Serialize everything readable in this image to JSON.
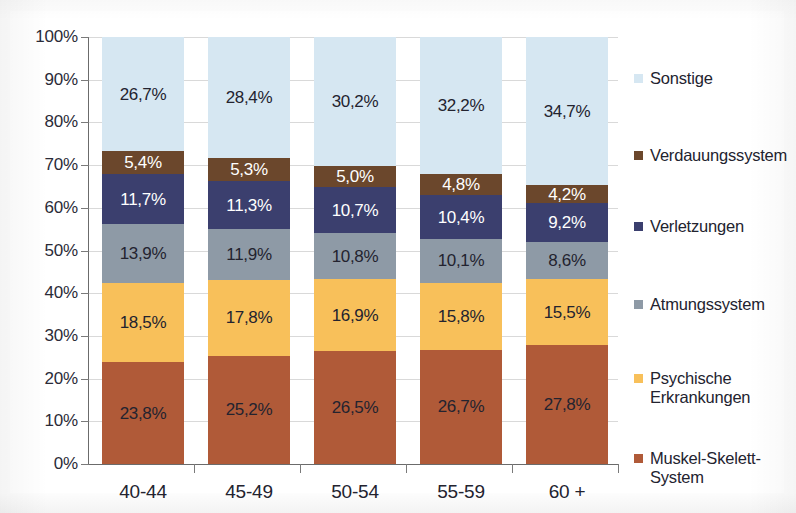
{
  "chart_data": {
    "type": "bar",
    "subtype": "stacked-100-percent",
    "title": "",
    "xlabel": "",
    "ylabel": "",
    "ylim": [
      0,
      100
    ],
    "ytick_labels": [
      "0%",
      "10%",
      "20%",
      "30%",
      "40%",
      "50%",
      "60%",
      "70%",
      "80%",
      "90%",
      "100%"
    ],
    "ytick_values": [
      0,
      10,
      20,
      30,
      40,
      50,
      60,
      70,
      80,
      90,
      100
    ],
    "grid": true,
    "legend_position": "right",
    "categories": [
      "40-44",
      "45-49",
      "50-54",
      "55-59",
      "60 +"
    ],
    "series": [
      {
        "name": "Muskel-Skelett-System",
        "legend_label": "Muskel-Skelett-\nSystem",
        "color": "#b05a38",
        "label_color": "#23232f",
        "values": [
          23.8,
          25.2,
          26.5,
          26.7,
          27.8
        ],
        "value_labels": [
          "23,8%",
          "25,2%",
          "26,5%",
          "26,7%",
          "27,8%"
        ]
      },
      {
        "name": "Psychische Erkrankungen",
        "legend_label": "Psychische\nErkrankungen",
        "color": "#f8c05a",
        "label_color": "#23232f",
        "values": [
          18.5,
          17.8,
          16.9,
          15.8,
          15.5
        ],
        "value_labels": [
          "18,5%",
          "17,8%",
          "16,9%",
          "15,8%",
          "15,5%"
        ]
      },
      {
        "name": "Atmungssystem",
        "legend_label": "Atmungssystem",
        "color": "#8e9aa6",
        "label_color": "#23232f",
        "values": [
          13.9,
          11.9,
          10.8,
          10.1,
          8.6
        ],
        "value_labels": [
          "13,9%",
          "11,9%",
          "10,8%",
          "10,1%",
          "8,6%"
        ]
      },
      {
        "name": "Verletzungen",
        "legend_label": "Verletzungen",
        "color": "#3b3f6e",
        "label_color": "#ffffff",
        "values": [
          11.7,
          11.3,
          10.7,
          10.4,
          9.2
        ],
        "value_labels": [
          "11,7%",
          "11,3%",
          "10,7%",
          "10,4%",
          "9,2%"
        ]
      },
      {
        "name": "Verdauungssystem",
        "legend_label": "Verdauungssystem",
        "color": "#6b472c",
        "label_color": "#ffffff",
        "values": [
          5.4,
          5.3,
          5.0,
          4.8,
          4.2
        ],
        "value_labels": [
          "5,4%",
          "5,3%",
          "5,0%",
          "4,8%",
          "4,2%"
        ]
      },
      {
        "name": "Sonstige",
        "legend_label": "Sonstige",
        "color": "#d6e7f2",
        "label_color": "#23232f",
        "values": [
          26.7,
          28.4,
          30.2,
          32.2,
          34.7
        ],
        "value_labels": [
          "26,7%",
          "28,4%",
          "30,2%",
          "32,2%",
          "34,7%"
        ]
      }
    ]
  },
  "legend": {
    "items": [
      {
        "label": "Sonstige",
        "color": "#d6e7f2"
      },
      {
        "label": "Verdauungssystem",
        "color": "#6b472c"
      },
      {
        "label": "Verletzungen",
        "color": "#3b3f6e"
      },
      {
        "label": "Atmungssystem",
        "color": "#8e9aa6"
      },
      {
        "label": "Psychische\nErkrankungen",
        "color": "#f8c05a"
      },
      {
        "label": "Muskel-Skelett-\nSystem",
        "color": "#b05a38"
      }
    ]
  }
}
